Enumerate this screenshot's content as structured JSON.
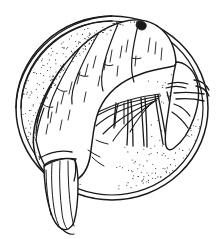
{
  "artwork": {
    "title": "Shrimp on a Round Plate",
    "subject": "cooked prawn / shrimp viewed from above, curled on a circular dish",
    "medium": "pen-and-ink line drawing with stipple shading",
    "alt_text": "Black and white line drawing of a curled shrimp resting on a round plate, its tail fan hanging over the lower-left rim and its legs and antennae splayed toward the center.",
    "background_color": "#ffffff",
    "ink_color": "#1a1a1a",
    "stipple_color": "#333333",
    "canvas": {
      "width": 219,
      "height": 239
    }
  },
  "plate": {
    "label": "round plate",
    "center_x": 112,
    "center_y": 108,
    "radius_x": 96,
    "radius_y": 92,
    "rim_style": "double contour line",
    "rim_gap_px": 5,
    "inner_texture": "stipple shading concentrated along upper-left and lower-right inner rim"
  },
  "shrimp": {
    "label": "shrimp",
    "orientation": "curled, head at right, tail toward lower left",
    "body_segments": 7,
    "segment_label": "abdominal shell segment",
    "parts": [
      {
        "name": "carapace-head",
        "label": "head / carapace",
        "position": "right"
      },
      {
        "name": "abdomen",
        "label": "segmented abdomen",
        "position": "arc across top"
      },
      {
        "name": "tail-fan",
        "label": "tail fan (uropods and telson)",
        "position": "lower left, overhanging rim"
      },
      {
        "name": "legs",
        "label": "walking legs (pereiopods)",
        "count": 5,
        "position": "center, hanging down"
      },
      {
        "name": "antennae",
        "label": "antennae and maxillipeds",
        "count": 6,
        "position": "center left, swept"
      },
      {
        "name": "rostrum",
        "label": "rostrum",
        "position": "far right"
      }
    ]
  },
  "rendering": {
    "stipple_dot_count": 420,
    "stipple_dot_radius": 0.55
  }
}
